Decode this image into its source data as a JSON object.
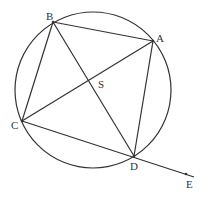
{
  "diagram": {
    "circle": {
      "cx": 93,
      "cy": 90,
      "r": 78
    },
    "points": {
      "A": {
        "x": 153,
        "y": 41,
        "label": "A"
      },
      "B": {
        "x": 53,
        "y": 22,
        "label": "B"
      },
      "C": {
        "x": 22,
        "y": 121,
        "label": "C"
      },
      "D": {
        "x": 134,
        "y": 156,
        "label": "D"
      },
      "S": {
        "label": "S"
      },
      "E": {
        "x": 186,
        "y": 174,
        "label": "E"
      }
    },
    "segments": [
      "AB",
      "BC",
      "CD",
      "DA",
      "AC",
      "BD",
      "DE"
    ]
  }
}
